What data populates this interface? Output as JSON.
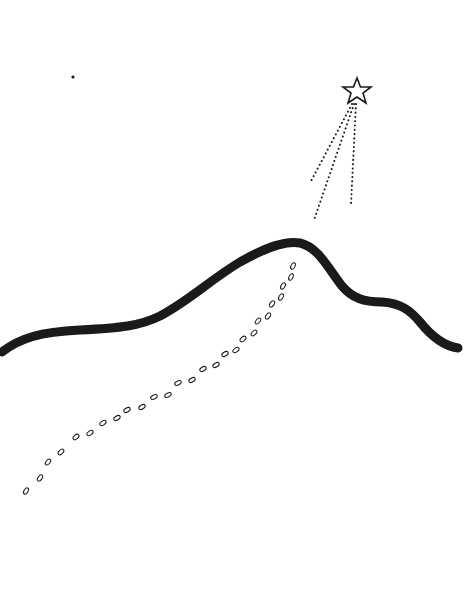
{
  "drawing": {
    "background": "#ffffff",
    "ink": "#1a1a1a",
    "elements": [
      {
        "name": "hill-outline",
        "type": "thick-curve"
      },
      {
        "name": "shooting-star",
        "type": "star-with-dotted-trails",
        "trails": 3
      },
      {
        "name": "footprints-trail",
        "type": "footprint-path",
        "count": 36
      },
      {
        "name": "small-star-dot",
        "type": "dot"
      }
    ]
  }
}
